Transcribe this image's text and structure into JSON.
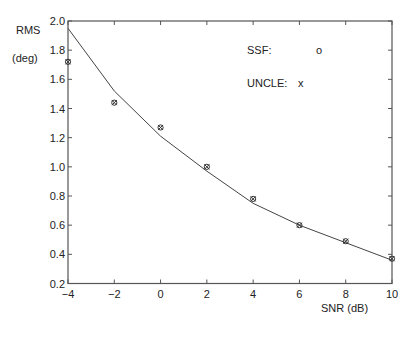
{
  "chart_data": {
    "type": "line",
    "title": "",
    "xlabel": "SNR (dB)",
    "ylabel_line1": "RMS",
    "ylabel_line2": "(deg)",
    "xlim": [
      -4,
      10
    ],
    "ylim": [
      0.2,
      2.0
    ],
    "xticks": [
      -4,
      -2,
      0,
      2,
      4,
      6,
      8,
      10
    ],
    "yticks": [
      0.2,
      0.4,
      0.6,
      0.8,
      1.0,
      1.2,
      1.4,
      1.6,
      1.8,
      2.0
    ],
    "ytick_labels": [
      "0.2",
      "0.4",
      "0.6",
      "0.8",
      "1.0",
      "1.2",
      "1.4",
      "1.6",
      "1.8",
      "2.0"
    ],
    "grid": false,
    "box": true,
    "legend": [
      {
        "label": "SSF:",
        "marker": "o"
      },
      {
        "label": "UNCLE:",
        "marker": "x"
      }
    ],
    "legend_position": "upper right (inside)",
    "x": [
      -4,
      -2,
      0,
      2,
      4,
      6,
      8,
      10
    ],
    "series": [
      {
        "name": "Bound (solid line)",
        "style": "line",
        "values": [
          1.95,
          1.52,
          1.21,
          0.97,
          0.75,
          0.6,
          0.48,
          0.36
        ]
      },
      {
        "name": "SSF",
        "style": "marker-o",
        "values": [
          1.72,
          1.44,
          1.27,
          1.0,
          0.78,
          0.6,
          0.49,
          0.37
        ]
      },
      {
        "name": "UNCLE",
        "style": "marker-x",
        "values": [
          1.72,
          1.44,
          1.27,
          1.0,
          0.78,
          0.6,
          0.49,
          0.37
        ]
      }
    ]
  },
  "colors": {
    "axis": "#555555",
    "line": "#444444",
    "marker": "#333333",
    "text": "#222222"
  }
}
